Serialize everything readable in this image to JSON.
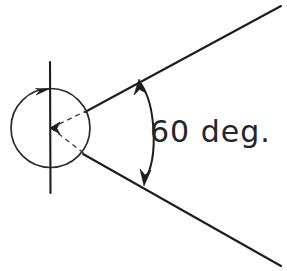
{
  "drawing": {
    "title": "Angle dimension diagram",
    "background_color": "#ffffff",
    "ink_color": "#1d1d1d",
    "annotations": {
      "angle_label": "60 deg.",
      "angle_value": 60,
      "angle_unit": "deg."
    },
    "elements": {
      "circle_name": "circle",
      "axis_name": "vertical-axis-line",
      "upper_ray_name": "upper-ray",
      "lower_ray_name": "lower-ray",
      "arc_name": "angle-arc",
      "dashed_upper_name": "dashed-radius-upper",
      "dashed_lower_name": "dashed-radius-lower"
    },
    "geometry": {
      "circle_center_x": 50.5,
      "circle_center_y": 128,
      "circle_radius": 39.5,
      "axis_top_y": 62,
      "axis_bottom_y": 193,
      "axis_x": 50,
      "upper_ray_start": [
        85,
        112
      ],
      "upper_ray_end": [
        281,
        6
      ],
      "lower_ray_start": [
        83,
        154
      ],
      "lower_ray_end": [
        281,
        266
      ],
      "arc_start": [
        141,
        83
      ],
      "arc_end": [
        144,
        181
      ],
      "label_x": 150,
      "label_y": 142
    }
  }
}
